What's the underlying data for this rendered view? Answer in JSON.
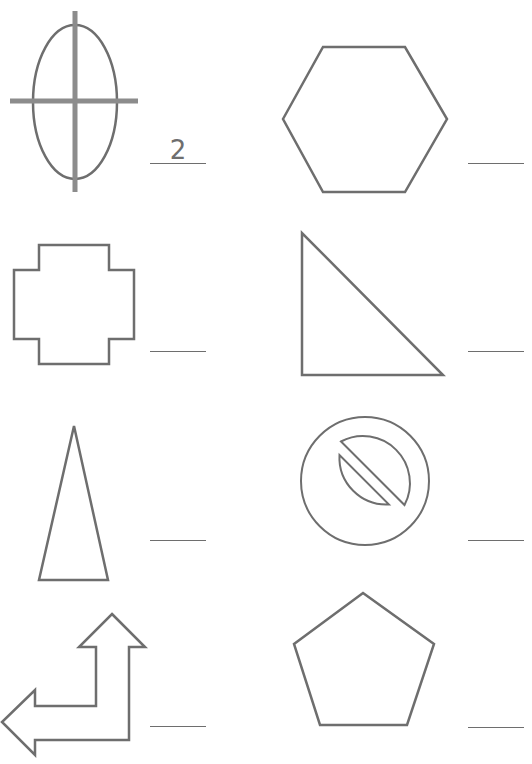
{
  "worksheet": {
    "stroke_color": "#6e6e6e",
    "items": [
      {
        "shape": "ellipse-with-axes",
        "answer": "2"
      },
      {
        "shape": "hexagon",
        "answer": ""
      },
      {
        "shape": "cross",
        "answer": ""
      },
      {
        "shape": "right-triangle",
        "answer": ""
      },
      {
        "shape": "isosceles-triangle",
        "answer": ""
      },
      {
        "shape": "no-symbol",
        "answer": ""
      },
      {
        "shape": "bent-arrow",
        "answer": ""
      },
      {
        "shape": "pentagon",
        "answer": ""
      }
    ]
  }
}
